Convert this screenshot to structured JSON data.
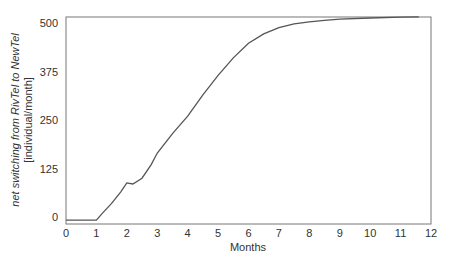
{
  "chart_data": {
    "type": "line",
    "title": "",
    "xlabel": "Months",
    "ylabel_line1": "net switching from RivTel to NewTel",
    "ylabel_line2": "[individual/month]",
    "xlim": [
      0,
      12
    ],
    "ylim": [
      0,
      500
    ],
    "grid": false,
    "x_ticks": [
      "0",
      "1",
      "2",
      "3",
      "4",
      "5",
      "6",
      "7",
      "8",
      "9",
      "10",
      "11",
      "12"
    ],
    "y_ticks": [
      "0",
      "125",
      "250",
      "375",
      "500"
    ],
    "series": [
      {
        "name": "net switching",
        "x": [
          0,
          1.0,
          1.2,
          1.5,
          1.8,
          2.0,
          2.2,
          2.5,
          2.8,
          3.0,
          3.5,
          4.0,
          4.5,
          5.0,
          5.5,
          6.0,
          6.5,
          7.0,
          7.5,
          8.0,
          8.5,
          9.0,
          10.0,
          11.0,
          11.6
        ],
        "values": [
          -8,
          -8,
          10,
          35,
          65,
          88,
          85,
          100,
          135,
          165,
          215,
          260,
          315,
          365,
          410,
          448,
          472,
          488,
          498,
          503,
          507,
          510,
          513,
          515,
          516
        ]
      }
    ],
    "line_color": "#555555"
  }
}
